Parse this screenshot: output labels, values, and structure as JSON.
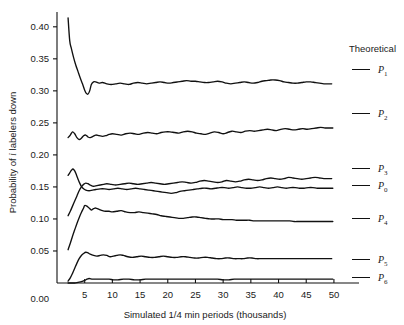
{
  "chart_data": {
    "type": "line",
    "title": "",
    "xlabel": "Simulated 1/4 min periods (thousands)",
    "ylabel": "Probability of i labelers down",
    "ylabel_parts": {
      "pre": "Probability of ",
      "italic": "i",
      "post": " labelers down"
    },
    "xlim": [
      0,
      52
    ],
    "ylim": [
      0,
      0.42
    ],
    "grid": false,
    "legend_position": "right",
    "legend_title": "Theoretical",
    "xticks": [
      5,
      10,
      15,
      20,
      25,
      30,
      35,
      40,
      45,
      50
    ],
    "xtick_labels": [
      "5",
      "10",
      "15",
      "20",
      "25",
      "30",
      "35",
      "40",
      "45",
      "50"
    ],
    "yticks": [
      0.0,
      0.05,
      0.1,
      0.15,
      0.2,
      0.25,
      0.3,
      0.35,
      0.4
    ],
    "ytick_labels": [
      "0.00",
      "0.05",
      "0.10",
      "0.15",
      "0.20",
      "0.25",
      "0.30",
      "0.35",
      "0.40"
    ],
    "line_color": "#111111",
    "series": [
      {
        "name": "P1",
        "label": "P",
        "subscript": "1",
        "theoretical": 0.312,
        "x": [
          2.0,
          2.3,
          2.6,
          3.0,
          3.4,
          3.8,
          4.2,
          4.6,
          5.0,
          5.3,
          5.6,
          5.9,
          6.2,
          6.6,
          7.0,
          7.6,
          8.2,
          9.0,
          9.8,
          10.6,
          11.4,
          12.2,
          13.0,
          13.8,
          14.6,
          15.4,
          16.2,
          17.0,
          17.8,
          18.6,
          19.4,
          20.2,
          21.0,
          21.8,
          22.6,
          23.4,
          24.2,
          25.0,
          25.8,
          26.6,
          27.4,
          28.2,
          29.0,
          29.8,
          30.6,
          31.4,
          32.2,
          33.0,
          33.8,
          34.6,
          35.4,
          36.2,
          37.0,
          37.8,
          38.6,
          39.4,
          40.2,
          41.0,
          41.8,
          42.6,
          43.4,
          44.2,
          45.0,
          45.8,
          46.6,
          47.4,
          48.2,
          49.0,
          49.6
        ],
        "y": [
          0.414,
          0.378,
          0.366,
          0.352,
          0.34,
          0.33,
          0.32,
          0.311,
          0.301,
          0.296,
          0.295,
          0.3,
          0.31,
          0.314,
          0.314,
          0.312,
          0.313,
          0.311,
          0.31,
          0.311,
          0.312,
          0.311,
          0.31,
          0.312,
          0.313,
          0.312,
          0.311,
          0.312,
          0.313,
          0.314,
          0.313,
          0.312,
          0.313,
          0.314,
          0.315,
          0.316,
          0.315,
          0.315,
          0.314,
          0.313,
          0.313,
          0.314,
          0.315,
          0.314,
          0.312,
          0.311,
          0.312,
          0.313,
          0.314,
          0.313,
          0.312,
          0.313,
          0.315,
          0.316,
          0.317,
          0.317,
          0.316,
          0.314,
          0.313,
          0.312,
          0.312,
          0.313,
          0.314,
          0.314,
          0.313,
          0.312,
          0.311,
          0.311,
          0.311
        ]
      },
      {
        "name": "P2",
        "label": "P",
        "subscript": "2",
        "theoretical": 0.243,
        "x": [
          2.0,
          2.4,
          2.8,
          3.2,
          3.6,
          4.0,
          4.4,
          4.8,
          5.2,
          5.6,
          6.0,
          6.5,
          7.0,
          7.6,
          8.2,
          8.8,
          9.4,
          10.0,
          10.8,
          11.6,
          12.4,
          13.2,
          14.0,
          14.8,
          15.6,
          16.4,
          17.2,
          18.0,
          18.8,
          19.6,
          20.4,
          21.2,
          22.0,
          22.8,
          23.6,
          24.4,
          25.2,
          26.0,
          26.8,
          27.6,
          28.4,
          29.2,
          30.0,
          30.8,
          31.6,
          32.4,
          33.2,
          34.0,
          34.8,
          35.6,
          36.4,
          37.2,
          38.0,
          38.8,
          39.6,
          40.4,
          41.2,
          42.0,
          42.8,
          43.6,
          44.4,
          45.2,
          46.0,
          46.8,
          47.6,
          48.4,
          49.2,
          49.8
        ],
        "y": [
          0.227,
          0.231,
          0.236,
          0.233,
          0.227,
          0.224,
          0.226,
          0.23,
          0.231,
          0.228,
          0.227,
          0.229,
          0.231,
          0.23,
          0.229,
          0.23,
          0.232,
          0.233,
          0.232,
          0.231,
          0.233,
          0.234,
          0.233,
          0.232,
          0.234,
          0.235,
          0.234,
          0.233,
          0.235,
          0.236,
          0.236,
          0.235,
          0.234,
          0.236,
          0.237,
          0.236,
          0.234,
          0.233,
          0.232,
          0.234,
          0.236,
          0.235,
          0.233,
          0.235,
          0.237,
          0.236,
          0.235,
          0.237,
          0.238,
          0.237,
          0.238,
          0.239,
          0.24,
          0.239,
          0.238,
          0.24,
          0.241,
          0.24,
          0.239,
          0.24,
          0.241,
          0.24,
          0.241,
          0.242,
          0.243,
          0.242,
          0.242,
          0.242
        ]
      },
      {
        "name": "P3",
        "label": "P",
        "subscript": "3",
        "theoretical": 0.163,
        "x": [
          2.0,
          2.4,
          2.8,
          3.2,
          3.6,
          4.0,
          4.4,
          4.8,
          5.2,
          5.6,
          6.0,
          6.6,
          7.2,
          7.8,
          8.4,
          9.0,
          9.8,
          10.6,
          11.4,
          12.2,
          13.0,
          13.8,
          14.6,
          15.4,
          16.2,
          17.0,
          17.8,
          18.6,
          19.4,
          20.2,
          21.0,
          21.8,
          22.6,
          23.4,
          24.2,
          25.0,
          25.8,
          26.6,
          27.4,
          28.2,
          29.0,
          29.8,
          30.6,
          31.4,
          32.2,
          33.0,
          33.8,
          34.6,
          35.4,
          36.2,
          37.0,
          37.8,
          38.6,
          39.4,
          40.2,
          41.0,
          41.8,
          42.6,
          43.4,
          44.2,
          45.0,
          45.8,
          46.6,
          47.4,
          48.2,
          49.0,
          49.6
        ],
        "y": [
          0.105,
          0.112,
          0.12,
          0.128,
          0.136,
          0.144,
          0.15,
          0.154,
          0.156,
          0.155,
          0.153,
          0.151,
          0.152,
          0.153,
          0.154,
          0.155,
          0.154,
          0.153,
          0.154,
          0.155,
          0.156,
          0.155,
          0.154,
          0.155,
          0.156,
          0.157,
          0.156,
          0.155,
          0.154,
          0.155,
          0.156,
          0.157,
          0.158,
          0.157,
          0.156,
          0.157,
          0.159,
          0.16,
          0.159,
          0.158,
          0.157,
          0.158,
          0.16,
          0.159,
          0.158,
          0.159,
          0.161,
          0.162,
          0.161,
          0.16,
          0.161,
          0.163,
          0.164,
          0.163,
          0.162,
          0.163,
          0.165,
          0.164,
          0.163,
          0.162,
          0.163,
          0.164,
          0.165,
          0.164,
          0.163,
          0.163,
          0.163
        ]
      },
      {
        "name": "P0",
        "label": "P",
        "subscript": "0",
        "theoretical": 0.148,
        "x": [
          2.0,
          2.3,
          2.6,
          2.9,
          3.2,
          3.5,
          3.8,
          4.1,
          4.4,
          4.8,
          5.2,
          5.8,
          6.4,
          7.0,
          7.8,
          8.6,
          9.4,
          10.2,
          11.0,
          11.8,
          12.6,
          13.4,
          14.2,
          15.0,
          15.8,
          16.6,
          17.4,
          18.2,
          19.0,
          19.8,
          20.6,
          21.4,
          22.2,
          23.0,
          23.8,
          24.6,
          25.4,
          26.2,
          27.0,
          27.8,
          28.6,
          29.4,
          30.2,
          31.0,
          31.8,
          32.6,
          33.4,
          34.2,
          35.0,
          35.8,
          36.6,
          37.4,
          38.2,
          39.0,
          39.8,
          40.6,
          41.4,
          42.2,
          43.0,
          43.8,
          44.6,
          45.4,
          46.2,
          47.0,
          47.8,
          48.6,
          49.4,
          49.8
        ],
        "y": [
          0.168,
          0.172,
          0.176,
          0.178,
          0.175,
          0.169,
          0.162,
          0.156,
          0.151,
          0.147,
          0.145,
          0.144,
          0.145,
          0.146,
          0.147,
          0.147,
          0.146,
          0.147,
          0.148,
          0.147,
          0.146,
          0.147,
          0.148,
          0.147,
          0.146,
          0.145,
          0.144,
          0.143,
          0.142,
          0.141,
          0.14,
          0.141,
          0.143,
          0.144,
          0.145,
          0.146,
          0.147,
          0.148,
          0.148,
          0.147,
          0.148,
          0.149,
          0.149,
          0.148,
          0.149,
          0.15,
          0.149,
          0.148,
          0.148,
          0.149,
          0.15,
          0.149,
          0.148,
          0.149,
          0.15,
          0.149,
          0.148,
          0.149,
          0.149,
          0.148,
          0.148,
          0.149,
          0.149,
          0.148,
          0.148,
          0.148,
          0.148,
          0.148
        ]
      },
      {
        "name": "P4",
        "label": "P",
        "subscript": "4",
        "theoretical": 0.096,
        "x": [
          2.0,
          2.4,
          2.8,
          3.2,
          3.6,
          4.0,
          4.4,
          4.8,
          5.0,
          5.4,
          5.8,
          6.2,
          6.6,
          7.0,
          7.6,
          8.2,
          8.8,
          9.4,
          10.0,
          10.8,
          11.6,
          12.4,
          13.2,
          14.0,
          14.8,
          15.6,
          16.4,
          17.2,
          18.0,
          18.8,
          19.6,
          20.4,
          21.2,
          22.0,
          22.8,
          23.6,
          24.4,
          25.2,
          26.0,
          26.8,
          27.6,
          28.4,
          29.2,
          30.0,
          30.8,
          31.6,
          32.4,
          33.2,
          34.0,
          34.8,
          35.6,
          36.4,
          37.2,
          38.0,
          38.8,
          39.6,
          40.4,
          41.2,
          42.0,
          42.8,
          43.6,
          44.4,
          45.2,
          46.0,
          46.8,
          47.6,
          48.4,
          49.2,
          49.8
        ],
        "y": [
          0.052,
          0.062,
          0.073,
          0.083,
          0.093,
          0.102,
          0.11,
          0.117,
          0.121,
          0.12,
          0.117,
          0.114,
          0.116,
          0.117,
          0.115,
          0.113,
          0.112,
          0.112,
          0.111,
          0.112,
          0.113,
          0.111,
          0.11,
          0.11,
          0.111,
          0.11,
          0.109,
          0.108,
          0.107,
          0.105,
          0.104,
          0.103,
          0.102,
          0.101,
          0.101,
          0.102,
          0.103,
          0.103,
          0.102,
          0.101,
          0.1,
          0.1,
          0.1,
          0.099,
          0.099,
          0.099,
          0.098,
          0.098,
          0.098,
          0.098,
          0.097,
          0.097,
          0.097,
          0.097,
          0.097,
          0.097,
          0.097,
          0.097,
          0.097,
          0.096,
          0.096,
          0.096,
          0.096,
          0.096,
          0.096,
          0.096,
          0.096,
          0.096,
          0.096
        ]
      },
      {
        "name": "P5",
        "label": "P",
        "subscript": "5",
        "theoretical": 0.038,
        "x": [
          2.0,
          2.4,
          2.8,
          3.2,
          3.6,
          4.0,
          4.4,
          4.8,
          5.2,
          5.6,
          6.0,
          6.6,
          7.2,
          7.8,
          8.4,
          9.0,
          9.6,
          10.2,
          10.8,
          11.4,
          12.0,
          12.8,
          13.6,
          14.4,
          15.2,
          16.0,
          16.8,
          17.6,
          18.4,
          19.2,
          20.0,
          20.8,
          21.6,
          22.4,
          23.2,
          24.0,
          24.8,
          25.6,
          26.4,
          27.2,
          28.0,
          28.8,
          29.6,
          30.4,
          31.2,
          32.0,
          32.8,
          33.6,
          34.4,
          35.2,
          36.0,
          36.8,
          37.6,
          38.4,
          39.2,
          40.0,
          40.8,
          41.6,
          42.4,
          43.2,
          44.0,
          44.8,
          45.6,
          46.4,
          47.2,
          48.0,
          48.8,
          49.6
        ],
        "y": [
          0.003,
          0.008,
          0.015,
          0.023,
          0.031,
          0.038,
          0.043,
          0.046,
          0.048,
          0.047,
          0.045,
          0.043,
          0.042,
          0.043,
          0.044,
          0.043,
          0.041,
          0.042,
          0.043,
          0.044,
          0.043,
          0.041,
          0.04,
          0.041,
          0.042,
          0.041,
          0.04,
          0.04,
          0.041,
          0.042,
          0.041,
          0.04,
          0.04,
          0.041,
          0.041,
          0.04,
          0.039,
          0.039,
          0.04,
          0.04,
          0.039,
          0.038,
          0.038,
          0.039,
          0.039,
          0.038,
          0.038,
          0.038,
          0.039,
          0.039,
          0.038,
          0.038,
          0.038,
          0.038,
          0.038,
          0.038,
          0.038,
          0.038,
          0.038,
          0.038,
          0.038,
          0.038,
          0.038,
          0.038,
          0.038,
          0.038,
          0.038,
          0.038
        ]
      },
      {
        "name": "P6",
        "label": "P",
        "subscript": "6",
        "theoretical": 0.006,
        "x": [
          2.0,
          2.6,
          3.2,
          3.8,
          4.4,
          5.0,
          5.4,
          5.8,
          6.4,
          7.0,
          7.8,
          8.6,
          9.4,
          10.2,
          11.0,
          12.0,
          13.0,
          14.0,
          15.0,
          16.0,
          17.0,
          18.0,
          19.0,
          20.0,
          21.0,
          22.0,
          23.0,
          24.0,
          25.0,
          26.0,
          27.0,
          28.0,
          29.0,
          30.0,
          31.0,
          32.0,
          33.0,
          34.0,
          35.0,
          36.0,
          37.0,
          38.0,
          39.0,
          40.0,
          41.0,
          42.0,
          43.0,
          44.0,
          45.0,
          46.0,
          47.0,
          48.0,
          49.0,
          49.8
        ],
        "y": [
          0.0,
          0.0,
          0.0,
          0.001,
          0.002,
          0.004,
          0.006,
          0.007,
          0.006,
          0.006,
          0.006,
          0.006,
          0.006,
          0.005,
          0.005,
          0.006,
          0.006,
          0.005,
          0.005,
          0.006,
          0.006,
          0.006,
          0.006,
          0.006,
          0.006,
          0.006,
          0.006,
          0.006,
          0.006,
          0.006,
          0.006,
          0.006,
          0.006,
          0.005,
          0.005,
          0.006,
          0.006,
          0.006,
          0.006,
          0.006,
          0.006,
          0.006,
          0.006,
          0.006,
          0.006,
          0.006,
          0.006,
          0.006,
          0.006,
          0.006,
          0.006,
          0.006,
          0.006,
          0.006
        ]
      }
    ]
  }
}
